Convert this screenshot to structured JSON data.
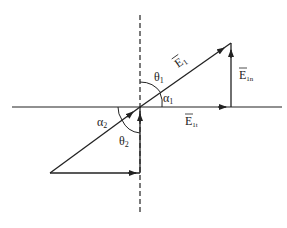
{
  "diagram": {
    "labels": {
      "e1": "E",
      "e1_sub": "1",
      "e1n": "E",
      "e1n_sub": "1n",
      "e1t": "E",
      "e1t_sub": "1t",
      "theta1": "θ",
      "theta1_sub": "1",
      "alpha1": "α",
      "alpha1_sub": "1",
      "alpha2": "α",
      "alpha2_sub": "2",
      "theta2": "θ",
      "theta2_sub": "2"
    },
    "colors": {
      "stroke": "#222222",
      "background": "#ffffff"
    }
  }
}
